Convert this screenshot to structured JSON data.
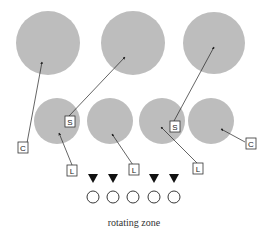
{
  "diagram": {
    "caption": "rotating zone",
    "colors": {
      "disc": "#bdbdbd",
      "stroke": "#222222",
      "marker": "#111111"
    },
    "labels": [
      {
        "id": "c1",
        "text": "C"
      },
      {
        "id": "s1",
        "text": "S"
      },
      {
        "id": "l1",
        "text": "L"
      },
      {
        "id": "l2",
        "text": "L"
      },
      {
        "id": "s2",
        "text": "S"
      },
      {
        "id": "l3",
        "text": "L"
      },
      {
        "id": "c2",
        "text": "C"
      }
    ],
    "markers": {
      "triangles": 4,
      "circles": 5
    }
  }
}
